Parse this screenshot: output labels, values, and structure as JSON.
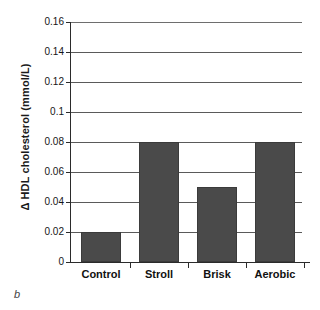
{
  "figure": {
    "caption": "b"
  },
  "chart_data": {
    "type": "bar",
    "title": "",
    "subtitle": "",
    "xlabel": "",
    "ylabel": "Δ HDL cholesterol (mmol/L)",
    "categories": [
      "Control",
      "Stroll",
      "Brisk",
      "Aerobic"
    ],
    "values": [
      0.02,
      0.08,
      0.05,
      0.08
    ],
    "ylim": [
      0,
      0.16
    ],
    "ytick_values": [
      0,
      0.02,
      0.04,
      0.06,
      0.08,
      0.1,
      0.12,
      0.14,
      0.16
    ],
    "ytick_labels": [
      "0",
      "0.02",
      "0.04",
      "0.06",
      "0.08",
      "0.1",
      "0.12",
      "0.14",
      "0.16"
    ],
    "grid": true,
    "grid_axis": "y",
    "legend": null,
    "legend_position": "none",
    "annotations": [],
    "series": [
      {
        "name": "Δ HDL cholesterol",
        "values": [
          0.02,
          0.08,
          0.05,
          0.08
        ]
      }
    ],
    "colors": {
      "bar_fill": "#4a4a4a",
      "bar_edge": "#3b3b3b",
      "gridline": "#5a5a5a",
      "axis": "#2b2b2b",
      "background": "#ffffff",
      "text": "#111111"
    }
  }
}
